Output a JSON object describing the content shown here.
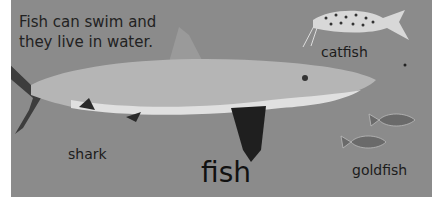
{
  "intro": {
    "line1": "Fish can swim and",
    "line2": "they live in water."
  },
  "labels": {
    "shark": "shark",
    "catfish": "catfish",
    "goldfish": "goldfish",
    "fish": "fish"
  },
  "colors": {
    "background": "#8b8b8b",
    "text": "#1a1a1a"
  }
}
